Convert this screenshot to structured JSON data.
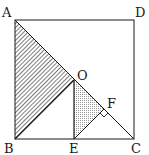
{
  "figure": {
    "type": "geometry",
    "colors": {
      "stroke": "#1a1a1a",
      "background": "#ffffff",
      "hatch": "#444444",
      "dots": "#888888"
    },
    "points": {
      "A": {
        "label": "A",
        "x": 15,
        "y": 20
      },
      "D": {
        "label": "D",
        "x": 134,
        "y": 20
      },
      "B": {
        "label": "B",
        "x": 15,
        "y": 139
      },
      "C": {
        "label": "C",
        "x": 134,
        "y": 139
      },
      "O": {
        "label": "O",
        "x": 74,
        "y": 80
      },
      "E": {
        "label": "E",
        "x": 74,
        "y": 139
      },
      "F": {
        "label": "F",
        "x": 104,
        "y": 109
      }
    },
    "labels": {
      "A": "A",
      "B": "B",
      "C": "C",
      "D": "D",
      "O": "O",
      "E": "E",
      "F": "F"
    }
  }
}
